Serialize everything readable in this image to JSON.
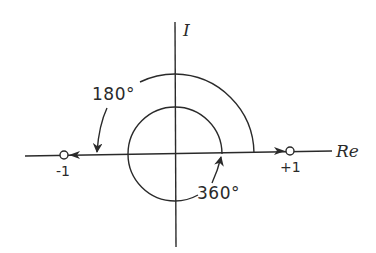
{
  "diagram": {
    "type": "polar-plane-sketch",
    "axes": {
      "real_label": "Re",
      "imag_label": "I"
    },
    "points": [
      {
        "id": "minus-one",
        "label": "-1",
        "marker": "open-circle"
      },
      {
        "id": "plus-one",
        "label": "+1",
        "marker": "open-circle"
      }
    ],
    "arcs": [
      {
        "id": "outer-arc",
        "label": "180°",
        "description": "arc from +Re axis sweeping counterclockwise to -Re axis with arrow toward -1"
      },
      {
        "id": "inner-circle",
        "label": "360°",
        "description": "full circle around origin with arrow ending on +Re axis"
      }
    ],
    "arrows_on_axis": [
      {
        "id": "arrow-toward-minus-one",
        "direction": "left"
      },
      {
        "id": "arrow-toward-plus-one",
        "direction": "right"
      }
    ],
    "colors": {
      "stroke": "#2a2a2a",
      "background": "#ffffff"
    }
  }
}
